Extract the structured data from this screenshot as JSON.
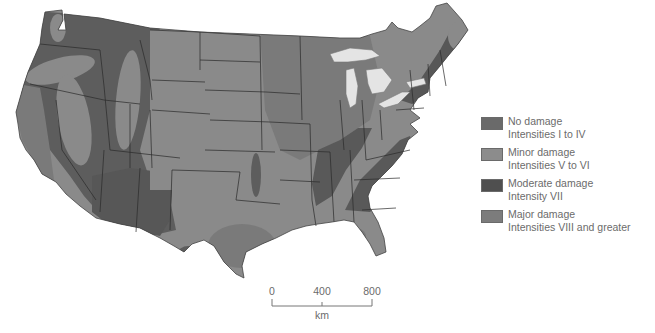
{
  "map": {
    "title": "",
    "region": "Contiguous United States",
    "colors": {
      "no_damage": "#6a6a6a",
      "minor_damage": "#8c8c8c",
      "moderate_damage": "#505050",
      "major_damage": "#787878",
      "lakes": "#e4e4e4",
      "borders": "#2a2a2a",
      "background": "#ffffff"
    }
  },
  "legend": {
    "items": [
      {
        "title": "No damage",
        "subtitle": "Intensities I to IV",
        "color": "#6a6a6a"
      },
      {
        "title": "Minor damage",
        "subtitle": "Intensities V to VI",
        "color": "#8c8c8c"
      },
      {
        "title": "Moderate damage",
        "subtitle": "Intensity VII",
        "color": "#4f4f4f"
      },
      {
        "title": "Major damage",
        "subtitle": "Intensities VIII and greater",
        "color": "#7c7c7c"
      }
    ]
  },
  "scale_bar": {
    "ticks": [
      "0",
      "400",
      "800"
    ],
    "unit": "km"
  }
}
